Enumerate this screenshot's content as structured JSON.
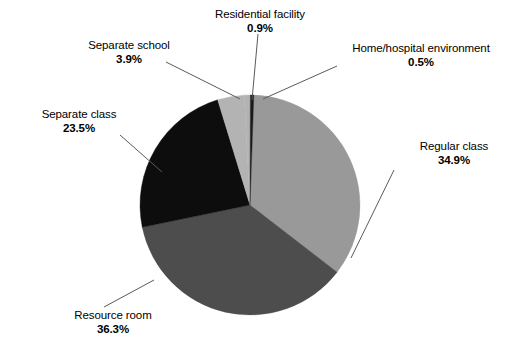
{
  "chart_data": {
    "type": "pie",
    "title": "",
    "subtitle": "",
    "xlabel": "",
    "ylabel": "",
    "legend_position": "none",
    "grid": false,
    "unit": "%",
    "categories": [
      "Regular class",
      "Resource room",
      "Separate class",
      "Separate school",
      "Residential facility",
      "Home/hospital environment"
    ],
    "values": [
      34.9,
      36.3,
      23.5,
      3.9,
      0.9,
      0.5
    ],
    "slices": [
      {
        "id": "regular-class",
        "label": "Regular class",
        "value_text": "34.9%",
        "value": 34.9,
        "color": "#999999",
        "start_angle": 2.0,
        "sweep_angle": 125.64
      },
      {
        "id": "resource-room",
        "label": "Resource room",
        "value_text": "36.3%",
        "value": 36.3,
        "color": "#4d4d4d",
        "start_angle": 127.64,
        "sweep_angle": 130.68
      },
      {
        "id": "separate-class",
        "label": "Separate class",
        "value_text": "23.5%",
        "value": 23.5,
        "color": "#0d0d0d",
        "start_angle": 258.32,
        "sweep_angle": 84.6
      },
      {
        "id": "separate-school",
        "label": "Separate school",
        "value_text": "3.9%",
        "value": 3.9,
        "color": "#b3b3b3",
        "start_angle": 342.92,
        "sweep_angle": 14.04
      },
      {
        "id": "residential-facility",
        "label": "Residential facility",
        "value_text": "0.9%",
        "value": 0.9,
        "color": "#b3b3b3",
        "start_angle": 356.96,
        "sweep_angle": 3.24
      },
      {
        "id": "home-hospital-environment",
        "label": "Home/hospital environment",
        "value_text": "0.5%",
        "value": 0.5,
        "color": "#1a1a1a",
        "start_angle": 0.2,
        "sweep_angle": 1.8
      }
    ]
  },
  "labels": {
    "residential_facility": {
      "name": "Residential facility",
      "value": "0.9%"
    },
    "home_hospital": {
      "name": "Home/hospital environment",
      "value": "0.5%"
    },
    "separate_school": {
      "name": "Separate school",
      "value": "3.9%"
    },
    "separate_class": {
      "name": "Separate class",
      "value": "23.5%"
    },
    "regular_class": {
      "name": "Regular class",
      "value": "34.9%"
    },
    "resource_room": {
      "name": "Resource room",
      "value": "36.3%"
    }
  },
  "style": {
    "background": "#ffffff",
    "text_color": "#000000",
    "leader_line_color": "#5a5a5a",
    "pie_center_x": 250,
    "pie_center_y": 205,
    "pie_radius": 110
  }
}
